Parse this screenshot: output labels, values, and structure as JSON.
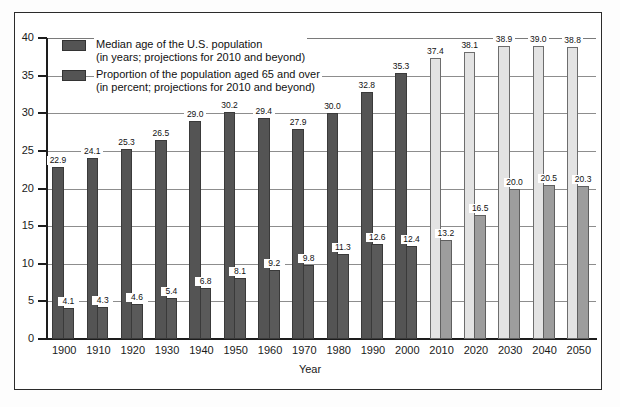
{
  "chart_data": {
    "type": "bar",
    "title": "",
    "xlabel": "Year",
    "ylabel": "",
    "ylim": [
      0,
      40
    ],
    "yticks": [
      "0",
      "5",
      "10",
      "15",
      "20",
      "25",
      "30",
      "35",
      "40"
    ],
    "grid": true,
    "legend_position": "top-left",
    "categories": [
      "1900",
      "1910",
      "1920",
      "1930",
      "1940",
      "1950",
      "1960",
      "1970",
      "1980",
      "1990",
      "2000",
      "2010",
      "2020",
      "2030",
      "2040",
      "2050"
    ],
    "series": [
      {
        "name": "Median age of the U.S. population",
        "note": "(in years; projections for 2010 and beyond)",
        "color": "#545454",
        "projection_color": "#e3e3e3",
        "values": [
          22.9,
          24.1,
          25.3,
          26.5,
          29.0,
          30.2,
          29.4,
          27.9,
          30.0,
          32.8,
          35.3,
          37.4,
          38.1,
          38.9,
          39.0,
          38.8
        ],
        "labels": [
          "22.9",
          "24.1",
          "25.3",
          "26.5",
          "29.0",
          "30.2",
          "29.4",
          "27.9",
          "30.0",
          "32.8",
          "35.3",
          "37.4",
          "38.1",
          "38.9",
          "39.0",
          "38.8"
        ]
      },
      {
        "name": "Proportion of the population aged 65 and over",
        "note": "(in percent; projections for 2010 and beyond)",
        "color": "#5a5a5a",
        "projection_color": "#9d9d9d",
        "values": [
          4.1,
          4.3,
          4.6,
          5.4,
          6.8,
          8.1,
          9.2,
          9.8,
          11.3,
          12.6,
          12.4,
          13.2,
          16.5,
          20.0,
          20.5,
          20.3
        ],
        "labels": [
          "4.1",
          "4.3",
          "4.6",
          "5.4",
          "6.8",
          "8.1",
          "9.2",
          "9.8",
          "11.3",
          "12.6",
          "12.4",
          "13.2",
          "16.5",
          "20.0",
          "20.5",
          "20.3"
        ]
      }
    ],
    "projection_start_index": 11
  },
  "legend": {
    "items": [
      {
        "line1": "Median age of the U.S. population",
        "line2": "(in years; projections for 2010 and beyond)"
      },
      {
        "line1": "Proportion of the population aged 65 and over",
        "line2": "(in percent; projections for 2010 and beyond)"
      }
    ]
  }
}
